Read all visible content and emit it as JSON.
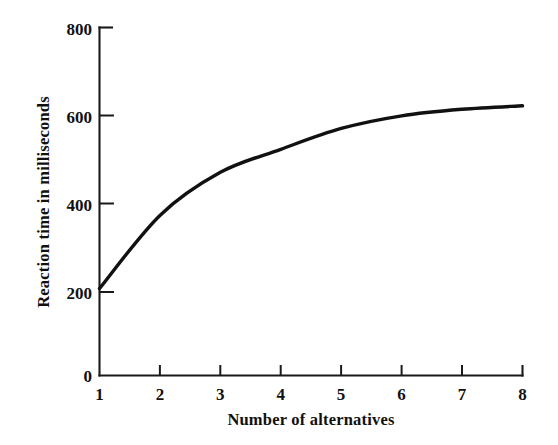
{
  "chart_data": {
    "type": "line",
    "title": "",
    "subtitle": "",
    "xlabel": "Number of alternatives",
    "ylabel": "Reaction time in milliseconds",
    "x": [
      1,
      2,
      3,
      4,
      5,
      6,
      7,
      8
    ],
    "values": [
      200,
      368,
      467,
      520,
      568,
      597,
      612,
      620
    ],
    "series": [
      {
        "name": "Reaction time",
        "values": [
          200,
          368,
          467,
          520,
          568,
          597,
          612,
          620
        ]
      }
    ],
    "xtick_labels": [
      "1",
      "2",
      "3",
      "4",
      "5",
      "6",
      "7",
      "8"
    ],
    "ytick_labels": [
      "0",
      "200",
      "400",
      "600",
      "800"
    ],
    "ytick_values": [
      0,
      200,
      400,
      600,
      800
    ],
    "xlim": [
      1,
      8
    ],
    "ylim": [
      0,
      800
    ],
    "grid": false,
    "legend": false,
    "legend_position": "none",
    "line_color": "#111111",
    "axis_color": "#1a1a1a",
    "background_color": "#ffffff",
    "annotations": []
  },
  "axes": {
    "y_title": "Reaction time in milliseconds",
    "x_title": "Number of alternatives"
  }
}
